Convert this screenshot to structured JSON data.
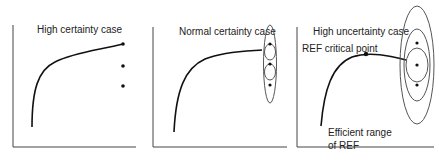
{
  "panels": [
    {
      "title": "High certainty case"
    },
    {
      "title": "Normal certainty case"
    },
    {
      "title": "High uncertainty case",
      "annotations": {
        "critical_point": "REF critical point",
        "efficient_range_line1": "Efficient range",
        "efficient_range_line2": "of REF"
      }
    }
  ],
  "colors": {
    "stroke": "#222222",
    "ellipse": "#555555"
  }
}
